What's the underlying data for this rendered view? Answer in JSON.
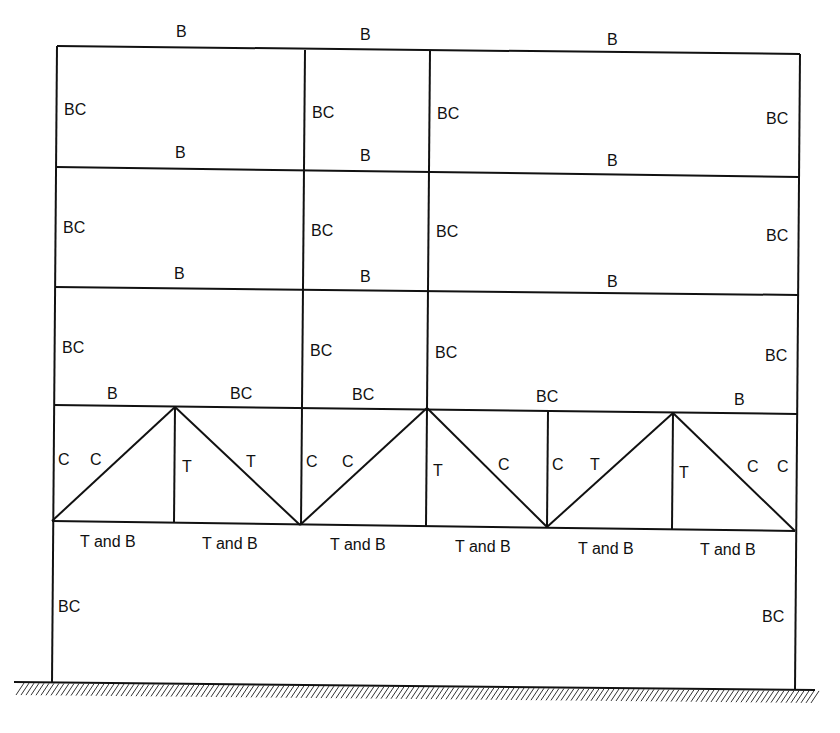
{
  "diagram": {
    "legend_meaning": {
      "B": "bending",
      "BC": "bending and compression",
      "C": "compression",
      "T": "tension",
      "T and B": "tension and bending"
    },
    "stories": [
      {
        "name": "story-4-top",
        "beam_labels": [
          "B",
          "B",
          "B"
        ],
        "column_labels": [
          "BC",
          "BC",
          "BC",
          "BC"
        ]
      },
      {
        "name": "story-3",
        "beam_labels": [
          "B",
          "B",
          "B"
        ],
        "column_labels": [
          "BC",
          "BC",
          "BC",
          "BC"
        ]
      },
      {
        "name": "story-2",
        "beam_labels": [
          "B",
          "B",
          "B"
        ],
        "column_labels": [
          "BC",
          "BC",
          "BC",
          "BC"
        ]
      },
      {
        "name": "truss-story",
        "top_chord_labels": [
          "B",
          "BC",
          "BC",
          "BC",
          "B"
        ],
        "web_labels": [
          "C",
          "C",
          "T",
          "T",
          "C",
          "C",
          "T",
          "C",
          "C",
          "T",
          "T",
          "C",
          "C"
        ],
        "bottom_chord_labels": [
          "T and B",
          "T and B",
          "T and B",
          "T and B",
          "T and B",
          "T and B"
        ]
      },
      {
        "name": "ground-story",
        "column_labels": [
          "BC",
          "BC"
        ]
      }
    ],
    "support": "fixed-ground-hatched"
  }
}
